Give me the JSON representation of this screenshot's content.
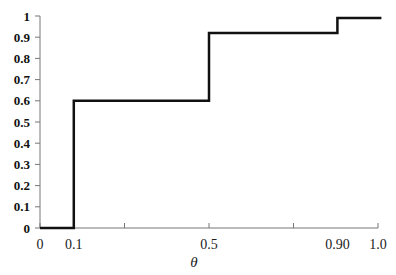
{
  "chart_data": {
    "type": "line",
    "subtype": "step",
    "title": "",
    "xlabel": "θ",
    "ylabel": "",
    "xlim": [
      0,
      1.0
    ],
    "ylim": [
      0,
      1
    ],
    "grid": false,
    "legend": null,
    "y_ticks": [
      0,
      0.1,
      0.2,
      0.3,
      0.4,
      0.5,
      0.6,
      0.7,
      0.8,
      0.9,
      1
    ],
    "y_tick_labels": [
      "0",
      "0.1",
      "0.2",
      "0.3",
      "0.4",
      "0.5",
      "0.6",
      "0.7",
      "0.8",
      "0.9",
      "1"
    ],
    "x_ticks": [
      0,
      0.25,
      0.5,
      0.75,
      1.0
    ],
    "x_tick_labels": [
      {
        "text": "0",
        "x": 0
      },
      {
        "text": "0.1",
        "x": 0.1
      },
      {
        "text": "0.5",
        "x": 0.5
      },
      {
        "text": "0.90",
        "x": 0.88
      },
      {
        "text": "1.0",
        "x": 1.0
      }
    ],
    "series": [
      {
        "name": "step",
        "color": "#111111",
        "points": [
          [
            0,
            0
          ],
          [
            0.1,
            0
          ],
          [
            0.1,
            0.6
          ],
          [
            0.5,
            0.6
          ],
          [
            0.5,
            0.92
          ],
          [
            0.88,
            0.92
          ],
          [
            0.88,
            0.99
          ],
          [
            1.01,
            0.99
          ]
        ]
      }
    ]
  },
  "layout": {
    "x0_px": 40,
    "x1_px": 378,
    "y0_px": 228,
    "y1_px": 16
  }
}
